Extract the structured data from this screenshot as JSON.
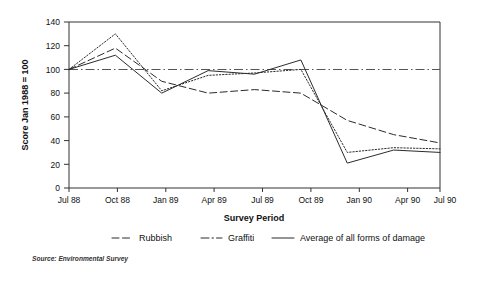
{
  "chart_data": {
    "type": "line",
    "title": "",
    "xlabel": "Survey Period",
    "ylabel": "Score Jan 1988 = 100",
    "categories": [
      "Jul 88",
      "Oct 88",
      "Jan 89",
      "Apr 89",
      "Jul 89",
      "Oct 89",
      "Jan 90",
      "Apr 90",
      "Jul 90"
    ],
    "ylim": [
      0,
      140
    ],
    "yticks": [
      0,
      20,
      40,
      60,
      80,
      100,
      120,
      140
    ],
    "grid": false,
    "legend_position": "bottom",
    "reference_line": {
      "value": 100,
      "style": "dash-dot",
      "label": ""
    },
    "series": [
      {
        "name": "Rubbish",
        "style": "dashed",
        "values": [
          100,
          118,
          90,
          80,
          83,
          80,
          57,
          45,
          38
        ]
      },
      {
        "name": "Graffiti",
        "style": "dotted",
        "values": [
          100,
          130,
          82,
          95,
          97,
          100,
          30,
          34,
          33
        ]
      },
      {
        "name": "Average of all forms of damage",
        "style": "solid",
        "values": [
          100,
          112,
          80,
          99,
          96,
          108,
          21,
          32,
          30
        ]
      }
    ]
  },
  "source": {
    "note": "Source: Environmental Survey"
  },
  "axes": {
    "y_title": "Score Jan 1988 = 100",
    "x_title": "Survey Period"
  },
  "legend": {
    "items": [
      {
        "label": "Rubbish"
      },
      {
        "label": "Graffiti"
      },
      {
        "label": "Average of all forms of damage"
      }
    ]
  },
  "colors": {
    "ink": "#2b2b2b",
    "frame": "#333333",
    "background": "#ffffff"
  }
}
